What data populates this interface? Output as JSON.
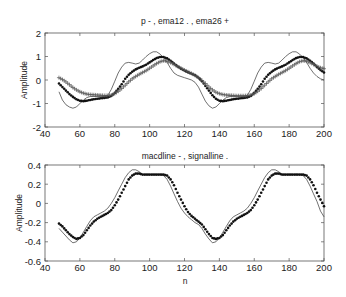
{
  "chart_data": [
    {
      "type": "line",
      "title": "p - ,   ema12 .  , ema26  +",
      "xlabel": "",
      "ylabel": "Amplitude",
      "xlim": [
        40,
        200
      ],
      "ylim": [
        -2,
        2
      ],
      "xticks": [
        40,
        60,
        80,
        100,
        120,
        140,
        160,
        180,
        200
      ],
      "yticks": [
        -2,
        -1,
        0,
        1,
        2
      ],
      "grid": false,
      "x_start": 48,
      "x_step": 2,
      "series": [
        {
          "name": "p",
          "style": "thin-line",
          "values": [
            -0.5,
            -0.85,
            -1.05,
            -1.15,
            -1.2,
            -1.15,
            -1.0,
            -0.85,
            -0.75,
            -0.7,
            -0.7,
            -0.7,
            -0.7,
            -0.7,
            -0.65,
            -0.4,
            -0.05,
            0.3,
            0.55,
            0.72,
            0.75,
            0.72,
            0.68,
            0.72,
            0.85,
            1.0,
            1.12,
            1.2,
            1.2,
            1.1,
            0.95,
            0.75,
            0.5,
            0.3,
            0.2,
            0.15,
            0.1,
            0.05,
            0.0,
            -0.1,
            -0.3,
            -0.6,
            -0.9,
            -1.1,
            -1.2,
            -1.15,
            -1.0,
            -0.85,
            -0.75,
            -0.7,
            -0.7,
            -0.7,
            -0.7,
            -0.7,
            -0.65,
            -0.4,
            -0.05,
            0.3,
            0.55,
            0.72,
            0.75,
            0.72,
            0.68,
            0.72,
            0.85,
            1.0,
            1.12,
            1.2,
            1.2,
            1.1,
            0.95,
            0.75,
            0.5,
            0.3,
            0.15,
            0.05,
            0.0
          ]
        },
        {
          "name": "ema12",
          "style": "dots",
          "values": [
            -0.15,
            -0.3,
            -0.45,
            -0.6,
            -0.72,
            -0.82,
            -0.88,
            -0.9,
            -0.88,
            -0.85,
            -0.82,
            -0.8,
            -0.78,
            -0.76,
            -0.74,
            -0.68,
            -0.55,
            -0.38,
            -0.18,
            0.05,
            0.22,
            0.35,
            0.45,
            0.52,
            0.58,
            0.65,
            0.75,
            0.85,
            0.93,
            0.98,
            0.98,
            0.92,
            0.82,
            0.7,
            0.58,
            0.48,
            0.4,
            0.33,
            0.27,
            0.2,
            0.1,
            -0.05,
            -0.25,
            -0.45,
            -0.65,
            -0.8,
            -0.88,
            -0.9,
            -0.88,
            -0.85,
            -0.82,
            -0.8,
            -0.78,
            -0.76,
            -0.74,
            -0.68,
            -0.55,
            -0.38,
            -0.18,
            0.05,
            0.22,
            0.35,
            0.45,
            0.52,
            0.58,
            0.65,
            0.75,
            0.85,
            0.93,
            0.98,
            0.98,
            0.92,
            0.82,
            0.7,
            0.55,
            0.42,
            0.32
          ]
        },
        {
          "name": "ema26",
          "style": "plus-markers",
          "values": [
            0.1,
            0.02,
            -0.08,
            -0.2,
            -0.32,
            -0.42,
            -0.5,
            -0.56,
            -0.6,
            -0.62,
            -0.63,
            -0.64,
            -0.65,
            -0.66,
            -0.66,
            -0.64,
            -0.58,
            -0.48,
            -0.36,
            -0.22,
            -0.08,
            0.05,
            0.15,
            0.24,
            0.32,
            0.4,
            0.5,
            0.6,
            0.7,
            0.78,
            0.82,
            0.8,
            0.74,
            0.66,
            0.58,
            0.5,
            0.42,
            0.35,
            0.28,
            0.2,
            0.1,
            -0.02,
            -0.15,
            -0.3,
            -0.42,
            -0.52,
            -0.58,
            -0.62,
            -0.64,
            -0.65,
            -0.66,
            -0.67,
            -0.67,
            -0.67,
            -0.66,
            -0.64,
            -0.58,
            -0.48,
            -0.36,
            -0.22,
            -0.08,
            0.05,
            0.15,
            0.24,
            0.32,
            0.4,
            0.5,
            0.6,
            0.7,
            0.78,
            0.82,
            0.8,
            0.74,
            0.66,
            0.58,
            0.52,
            0.48
          ]
        }
      ]
    },
    {
      "type": "line",
      "title": "macdline  - , signalline .",
      "xlabel": "n",
      "ylabel": "Amplitude",
      "xlim": [
        40,
        200
      ],
      "ylim": [
        -0.6,
        0.4
      ],
      "xticks": [
        40,
        60,
        80,
        100,
        120,
        140,
        160,
        180,
        200
      ],
      "yticks": [
        -0.6,
        -0.4,
        -0.2,
        0,
        0.2,
        0.4
      ],
      "grid": false,
      "x_start": 48,
      "x_step": 2,
      "series": [
        {
          "name": "macdline",
          "style": "thin-line",
          "values": [
            -0.26,
            -0.3,
            -0.34,
            -0.38,
            -0.41,
            -0.4,
            -0.36,
            -0.3,
            -0.24,
            -0.18,
            -0.14,
            -0.12,
            -0.1,
            -0.08,
            -0.05,
            0.0,
            0.06,
            0.13,
            0.2,
            0.27,
            0.32,
            0.35,
            0.35,
            0.33,
            0.3,
            0.3,
            0.3,
            0.3,
            0.3,
            0.3,
            0.29,
            0.25,
            0.18,
            0.1,
            0.02,
            -0.05,
            -0.1,
            -0.14,
            -0.17,
            -0.2,
            -0.22,
            -0.26,
            -0.32,
            -0.37,
            -0.41,
            -0.4,
            -0.36,
            -0.3,
            -0.24,
            -0.18,
            -0.14,
            -0.12,
            -0.1,
            -0.08,
            -0.05,
            0.0,
            0.06,
            0.13,
            0.2,
            0.27,
            0.32,
            0.35,
            0.35,
            0.33,
            0.3,
            0.3,
            0.3,
            0.3,
            0.3,
            0.3,
            0.29,
            0.25,
            0.18,
            0.1,
            0.02,
            -0.08,
            -0.14
          ]
        },
        {
          "name": "signalline",
          "style": "dots",
          "values": [
            -0.21,
            -0.24,
            -0.28,
            -0.32,
            -0.35,
            -0.37,
            -0.36,
            -0.33,
            -0.28,
            -0.23,
            -0.19,
            -0.16,
            -0.14,
            -0.12,
            -0.1,
            -0.07,
            -0.02,
            0.04,
            0.11,
            0.18,
            0.25,
            0.29,
            0.31,
            0.31,
            0.3,
            0.3,
            0.3,
            0.3,
            0.3,
            0.3,
            0.3,
            0.29,
            0.25,
            0.19,
            0.11,
            0.04,
            -0.03,
            -0.09,
            -0.13,
            -0.16,
            -0.19,
            -0.22,
            -0.27,
            -0.32,
            -0.36,
            -0.37,
            -0.36,
            -0.33,
            -0.28,
            -0.23,
            -0.19,
            -0.16,
            -0.14,
            -0.12,
            -0.1,
            -0.07,
            -0.02,
            0.04,
            0.11,
            0.18,
            0.25,
            0.29,
            0.31,
            0.31,
            0.3,
            0.3,
            0.3,
            0.3,
            0.3,
            0.3,
            0.3,
            0.29,
            0.25,
            0.19,
            0.11,
            0.04,
            -0.03
          ]
        }
      ]
    }
  ]
}
